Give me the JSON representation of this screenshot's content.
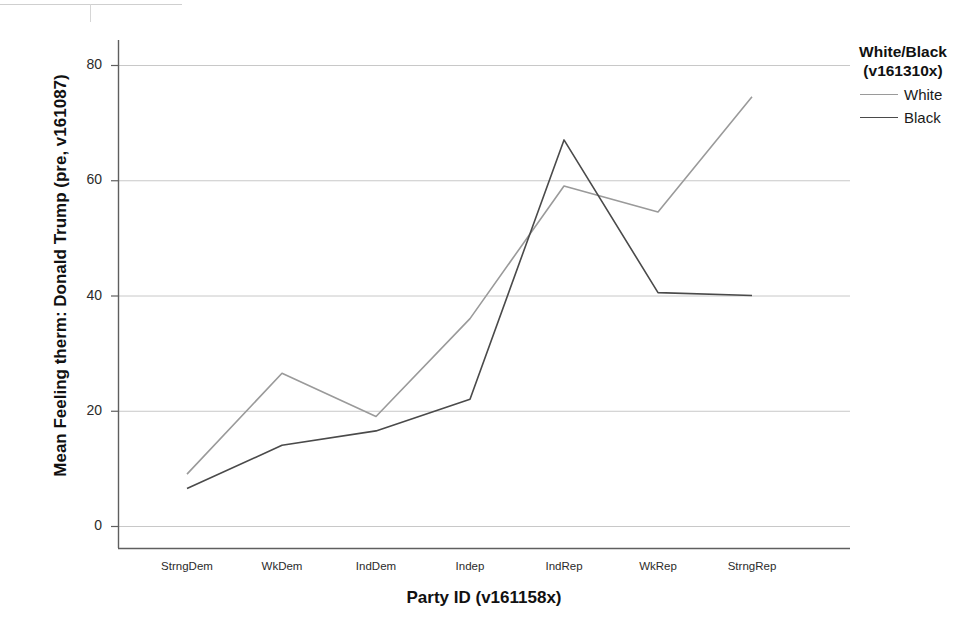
{
  "chart_data": {
    "type": "line",
    "title": "",
    "xlabel": "Party ID (v161158x)",
    "ylabel": "Mean Feeling therm: Donald Trump (pre, v161087)",
    "categories": [
      "StrngDem",
      "WkDem",
      "IndDem",
      "Indep",
      "IndRep",
      "WkRep",
      "StrngRep"
    ],
    "series": [
      {
        "name": "White",
        "color": "#9a9a9a",
        "values": [
          9,
          26.5,
          19,
          36,
          59,
          54.5,
          74.5
        ]
      },
      {
        "name": "Black",
        "color": "#4a4a4a",
        "values": [
          6.5,
          14,
          16.5,
          22,
          67,
          40.5,
          40
        ]
      }
    ],
    "ylim": [
      -2,
      85
    ],
    "yticks": [
      0,
      20,
      40,
      60,
      80
    ],
    "ytick_labels": [
      "0",
      "20",
      "40",
      "60",
      "80"
    ],
    "grid": true,
    "grid_color": "#c8c8c8",
    "legend_position": "right",
    "legend": {
      "title_line1": "White/Black",
      "title_line2": "(v161310x)",
      "entries": [
        {
          "label": "White",
          "color": "#9a9a9a"
        },
        {
          "label": "Black",
          "color": "#4a4a4a"
        }
      ]
    }
  },
  "axes": {
    "y_title": "Mean Feeling therm: Donald Trump (pre, v161087)",
    "x_title": "Party ID (v161158x)"
  }
}
